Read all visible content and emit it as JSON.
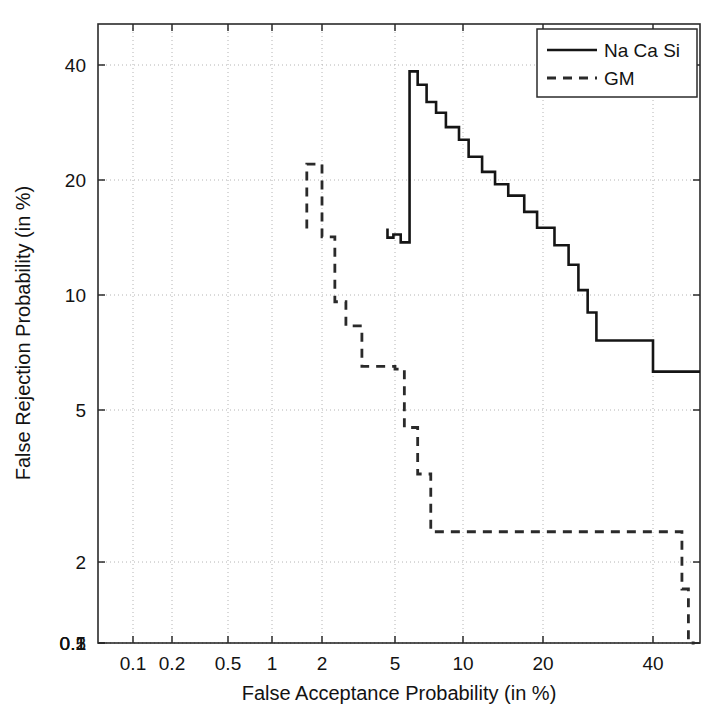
{
  "chart_data": {
    "type": "line",
    "title": "",
    "subtitle": "",
    "xlabel": "False Acceptance Probability (in %)",
    "ylabel": "False Rejection Probability (in %)",
    "scale": "DET (log-like warped axes)",
    "grid": true,
    "legend_position": "top-right",
    "xlim": [
      0.05,
      60
    ],
    "ylim": [
      0.07,
      55
    ],
    "xticks": [
      0.1,
      0.2,
      0.5,
      1,
      2,
      5,
      10,
      20,
      40
    ],
    "xtick_labels": [
      "0.1",
      "0.2",
      "0.5",
      "1",
      "2",
      "5",
      "10",
      "20",
      "40"
    ],
    "yticks": [
      0.1,
      0.2,
      0.5,
      1,
      2,
      5,
      10,
      20,
      40
    ],
    "ytick_labels": [
      "0.1",
      "0.2",
      "0.5",
      "1",
      "2",
      "5",
      "10",
      "20",
      "40"
    ],
    "series": [
      {
        "name": "Na Ca Si",
        "style": "solid",
        "color": "#151515",
        "step": "stair",
        "points": [
          [
            4.55,
            55.0
          ],
          [
            4.55,
            47.5
          ],
          [
            4.9,
            47.5
          ],
          [
            4.9,
            50.0
          ],
          [
            5.3,
            50.0
          ],
          [
            5.3,
            44.0
          ],
          [
            5.8,
            44.0
          ],
          [
            5.8,
            38.5
          ],
          [
            6.3,
            38.5
          ],
          [
            6.3,
            35.5
          ],
          [
            6.9,
            35.5
          ],
          [
            6.9,
            32.0
          ],
          [
            7.6,
            32.0
          ],
          [
            7.6,
            30.0
          ],
          [
            8.4,
            30.0
          ],
          [
            8.4,
            27.5
          ],
          [
            9.6,
            27.5
          ],
          [
            9.6,
            25.5
          ],
          [
            10.5,
            25.5
          ],
          [
            10.5,
            23.0
          ],
          [
            11.8,
            23.0
          ],
          [
            11.8,
            21.0
          ],
          [
            13.2,
            21.0
          ],
          [
            13.2,
            19.5
          ],
          [
            14.8,
            19.5
          ],
          [
            14.8,
            18.2
          ],
          [
            17.0,
            18.2
          ],
          [
            17.0,
            16.5
          ],
          [
            19.0,
            16.5
          ],
          [
            19.0,
            15.0
          ],
          [
            21.5,
            15.0
          ],
          [
            21.5,
            13.5
          ],
          [
            23.5,
            13.5
          ],
          [
            23.5,
            12.0
          ],
          [
            25.0,
            12.0
          ],
          [
            25.0,
            10.3
          ],
          [
            26.5,
            10.3
          ],
          [
            26.5,
            9.0
          ],
          [
            28.0,
            9.0
          ],
          [
            28.0,
            7.6
          ],
          [
            40.0,
            7.6
          ],
          [
            40.0,
            6.3
          ],
          [
            55.0,
            6.3
          ]
        ]
      },
      {
        "name": "GM",
        "style": "dashed",
        "color": "#2a2a2a",
        "step": "stair",
        "points": [
          [
            1.62,
            55.0
          ],
          [
            1.62,
            22.0
          ],
          [
            2.0,
            22.0
          ],
          [
            2.0,
            14.2
          ],
          [
            2.35,
            14.2
          ],
          [
            2.35,
            9.6
          ],
          [
            2.7,
            9.6
          ],
          [
            2.7,
            8.3
          ],
          [
            3.3,
            8.3
          ],
          [
            3.3,
            6.5
          ],
          [
            5.0,
            6.5
          ],
          [
            5.0,
            6.4
          ],
          [
            5.5,
            6.4
          ],
          [
            5.5,
            4.5
          ],
          [
            6.3,
            4.5
          ],
          [
            6.3,
            3.4
          ],
          [
            7.2,
            3.4
          ],
          [
            7.2,
            2.4
          ],
          [
            48.0,
            2.4
          ],
          [
            48.0,
            1.7
          ],
          [
            50.0,
            1.7
          ],
          [
            50.0,
            1.2
          ],
          [
            52.0,
            1.2
          ]
        ]
      }
    ]
  },
  "axes": {
    "x_title": "False Acceptance Probability (in %)",
    "y_title": "False Rejection Probability (in %)",
    "x_tick_labels": [
      "0.1",
      "0.2",
      "0.5",
      "1",
      "2",
      "5",
      "10",
      "20",
      "40"
    ],
    "y_tick_labels": [
      "40",
      "20",
      "10",
      "5",
      "2",
      "1",
      "0.5",
      "0.2",
      "0.1"
    ]
  },
  "legend": {
    "entries": [
      {
        "label": "Na Ca Si",
        "style": "solid"
      },
      {
        "label": "GM",
        "style": "dashed"
      }
    ]
  },
  "colors": {
    "background": "#ffffff",
    "axis": "#2b2b2b",
    "grid": "#b4b4b4",
    "series_solid": "#151515",
    "series_dashed": "#2a2a2a"
  }
}
